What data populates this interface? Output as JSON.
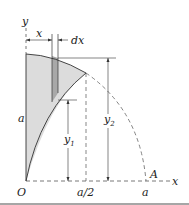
{
  "diagram": {
    "labels": {
      "y_axis": "y",
      "x_axis": "x",
      "origin": "O",
      "height": "a",
      "x_dim": "x",
      "dx_dim": "dx",
      "y1": "y",
      "y1_sub": "1",
      "y2": "y",
      "y2_sub": "2",
      "a_half": "a/2",
      "a_end": "a",
      "point_A": "A"
    },
    "colors": {
      "shaded_region": "#dcdcdc",
      "strip": "#a8a8a8",
      "lines": "#333333",
      "dashed": "#666666"
    }
  }
}
